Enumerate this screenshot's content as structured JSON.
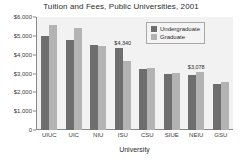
{
  "chart_data": {
    "type": "bar",
    "title": "Tuition and Fees, Public Universities, 2001",
    "xlabel": "University",
    "ylabel": "",
    "ylim": [
      0,
      6000
    ],
    "grid": false,
    "legend_position": "top-right",
    "categories": [
      "UIUC",
      "UIC",
      "NIU",
      "ISU",
      "CSU",
      "SIUE",
      "NEIU",
      "GSU"
    ],
    "ytick_labels": [
      "$6,000",
      "$5,000",
      "$4,000",
      "$3,000",
      "$2,000",
      "$1,000",
      "0"
    ],
    "ytick_values": [
      6000,
      5000,
      4000,
      3000,
      2000,
      1000,
      0
    ],
    "series": [
      {
        "name": "Undergraduate",
        "color": "#6e6e6e",
        "values": [
          4994,
          4776,
          4520,
          4340,
          3214,
          2966,
          2910,
          2440
        ]
      },
      {
        "name": "Graduate",
        "color": "#b3b3b3",
        "values": [
          5570,
          5410,
          4460,
          3640,
          3316,
          3040,
          3078,
          2550
        ]
      }
    ],
    "annotations": [
      {
        "text": "$4,340",
        "series": "Undergraduate",
        "category": "ISU"
      },
      {
        "text": "$3,078",
        "series": "Graduate",
        "category": "NEIU"
      }
    ]
  }
}
